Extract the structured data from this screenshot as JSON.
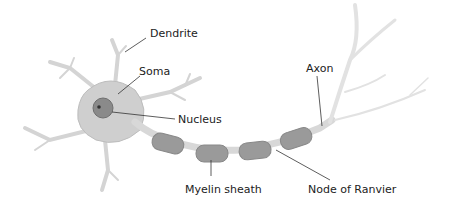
{
  "diagram": {
    "labels": {
      "dendrite": "Dendrite",
      "soma": "Soma",
      "nucleus": "Nucleus",
      "axon": "Axon",
      "myelin_sheath": "Myelin sheath",
      "node_of_ranvier": "Node of Ranvier"
    },
    "colors": {
      "cell_body": "#cfcfcf",
      "cell_outline": "#bdbdbd",
      "nucleus": "#8a8a8a",
      "nucleolus": "#333333",
      "myelin": "#9a9a9a",
      "axon": "#d8d8d8",
      "leader_line": "#333333",
      "text": "#222222",
      "background": "#ffffff"
    }
  }
}
